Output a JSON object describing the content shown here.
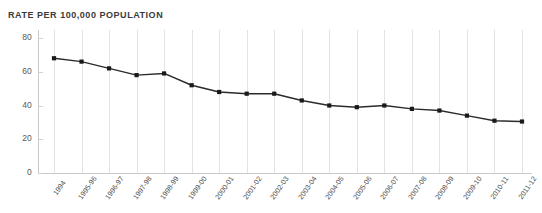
{
  "chart_data": {
    "type": "line",
    "title": "RATE PER 100,000 POPULATION",
    "xlabel": "",
    "ylabel": "",
    "ylim": [
      0,
      80
    ],
    "yticks": [
      0,
      20,
      40,
      60,
      80
    ],
    "ytick_labels": [
      "0",
      "20",
      "40",
      "60",
      "80"
    ],
    "grid": "vertical-only",
    "legend": "none",
    "line_color": "#2b2b2b",
    "marker_color": "#1a1a1a",
    "marker_shape": "square",
    "gridline_color": "#e3e3e3",
    "title_color": "#3b3b3b",
    "categories": [
      "1994",
      "1995-96",
      "1996-97",
      "1997-98",
      "1998-99",
      "1999-00",
      "2000-01",
      "2001-02",
      "2002-03",
      "2003-04",
      "2004-05",
      "2005-06",
      "2006-07",
      "2007-08",
      "2008-09",
      "2009-10",
      "2010-11",
      "2011-12"
    ],
    "values": [
      68,
      66,
      62,
      58,
      59,
      52,
      48,
      47,
      47,
      43,
      40,
      39,
      40,
      38,
      37,
      34,
      31,
      30.5
    ]
  }
}
